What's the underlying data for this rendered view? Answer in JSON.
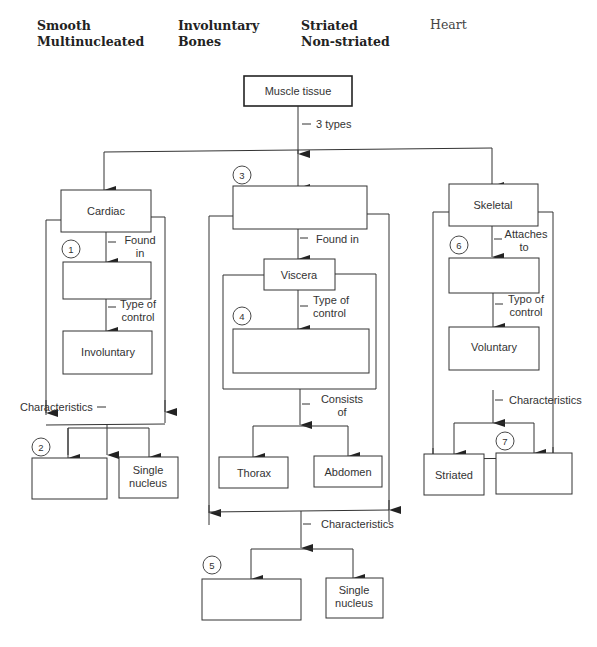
{
  "word_bank": {
    "col1": [
      "Smooth",
      "Multinucleated"
    ],
    "col2": [
      "Involuntary",
      "Bones"
    ],
    "col3": [
      "Striated",
      "Non-striated"
    ],
    "col4": [
      "Heart"
    ]
  },
  "root": {
    "label": "Muscle tissue",
    "edge_label": "3 types"
  },
  "cardiac": {
    "label": "Cardiac",
    "found_in_label": [
      "Found",
      "in"
    ],
    "blank1_number": "1",
    "type_of_control_label": [
      "Type of",
      "control"
    ],
    "control": "Involuntary",
    "characteristics_label": "Characteristics",
    "blank2_number": "2",
    "char2": [
      "Single",
      "nucleus"
    ]
  },
  "smooth": {
    "blank3_number": "3",
    "found_in_label": "Found in",
    "location": "Viscera",
    "type_of_control_label": [
      "Type of",
      "control"
    ],
    "blank4_number": "4",
    "consists_of_label": [
      "Consists",
      "of"
    ],
    "parts": [
      "Thorax",
      "Abdomen"
    ],
    "characteristics_label": "Characteristics",
    "blank5_number": "5",
    "char2": [
      "Single",
      "nucleus"
    ]
  },
  "skeletal": {
    "label": "Skeletal",
    "attaches_to_label": [
      "Attaches",
      "to"
    ],
    "blank6_number": "6",
    "type_of_control_label": [
      "Typo of",
      "control"
    ],
    "control": "Voluntary",
    "characteristics_label": "Characteristics",
    "char1": "Striated",
    "blank7_number": "7"
  }
}
